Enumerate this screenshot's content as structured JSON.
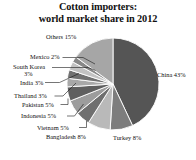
{
  "title": {
    "line1": "Cotton importers:",
    "line2": "world market share in 2012"
  },
  "labels": {
    "others": "Others 15%",
    "mexico": "Mexico 2%",
    "south_korea": "South Korea",
    "south_korea_pct": "3%",
    "india": "India 3%",
    "thailand": "Thailand 3%",
    "pakistan": "Pakistan 5%",
    "indonesia": "Indonesia 5%",
    "vietnam": "Vietnam 5%",
    "bangladesh": "Bangladesh 8%",
    "turkey": "Turkey 8%",
    "china": "China 43%"
  },
  "colors": {
    "china": "#555555",
    "turkey": "#7d7d7d",
    "bangladesh": "#b9b9b9",
    "vietnam": "#6f6f6f",
    "indonesia": "#9c9c9c",
    "pakistan": "#5f5f5f",
    "thailand": "#a8a8a8",
    "india": "#717171",
    "south_korea": "#c2c2c2",
    "mexico": "#888888",
    "others": "#a6a6a6",
    "separator": "#ffffff",
    "leader": "#1a1a1a",
    "text": "#111111",
    "background": "#ffffff"
  },
  "chart_data": {
    "type": "pie",
    "title": "Cotton importers: world market share in 2012",
    "unit": "%",
    "start_angle_deg": 0,
    "direction": "clockwise",
    "legend": "labels-with-leader-lines",
    "categories": [
      "China",
      "Turkey",
      "Bangladesh",
      "Vietnam",
      "Indonesia",
      "Pakistan",
      "Thailand",
      "India",
      "South Korea",
      "Mexico",
      "Others"
    ],
    "values": [
      43,
      8,
      8,
      5,
      5,
      5,
      3,
      3,
      3,
      2,
      15
    ],
    "total": 100,
    "slices": [
      {
        "name": "China",
        "value": 43,
        "label": "China 43%",
        "color": "#555555"
      },
      {
        "name": "Turkey",
        "value": 8,
        "label": "Turkey 8%",
        "color": "#7d7d7d"
      },
      {
        "name": "Bangladesh",
        "value": 8,
        "label": "Bangladesh 8%",
        "color": "#b9b9b9"
      },
      {
        "name": "Vietnam",
        "value": 5,
        "label": "Vietnam 5%",
        "color": "#6f6f6f"
      },
      {
        "name": "Indonesia",
        "value": 5,
        "label": "Indonesia 5%",
        "color": "#9c9c9c"
      },
      {
        "name": "Pakistan",
        "value": 5,
        "label": "Pakistan 5%",
        "color": "#5f5f5f"
      },
      {
        "name": "Thailand",
        "value": 3,
        "label": "Thailand 3%",
        "color": "#a8a8a8"
      },
      {
        "name": "India",
        "value": 3,
        "label": "India 3%",
        "color": "#717171"
      },
      {
        "name": "South Korea",
        "value": 3,
        "label": "South Korea 3%",
        "color": "#c2c2c2"
      },
      {
        "name": "Mexico",
        "value": 2,
        "label": "Mexico 2%",
        "color": "#888888"
      },
      {
        "name": "Others",
        "value": 15,
        "label": "Others 15%",
        "color": "#a6a6a6"
      }
    ]
  }
}
